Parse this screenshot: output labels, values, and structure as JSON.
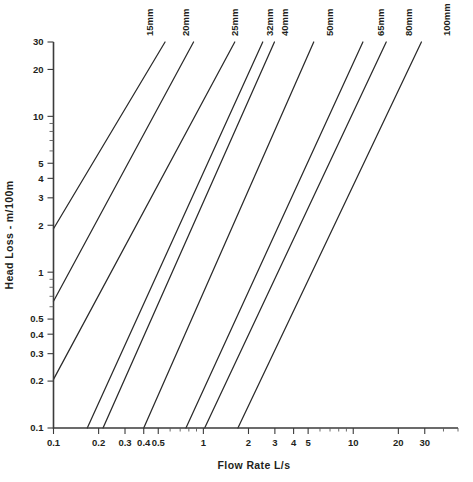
{
  "chart_data": {
    "type": "line",
    "title": "",
    "xlabel": "Flow Rate L/s",
    "ylabel": "Head Loss - m/100m",
    "xscale": "log",
    "yscale": "log",
    "xlim": [
      0.1,
      50
    ],
    "ylim": [
      0.1,
      30
    ],
    "grid": false,
    "legend_position": "top-inline-rotated",
    "x_tick_labels": [
      "0.1",
      "0.2",
      "0.3",
      "0.4",
      "0.5",
      "1",
      "2",
      "3",
      "4",
      "5",
      "10",
      "20",
      "30"
    ],
    "x_tick_values": [
      0.1,
      0.2,
      0.3,
      0.4,
      0.5,
      1,
      2,
      3,
      4,
      5,
      10,
      20,
      30
    ],
    "x_minor_ticks": [
      0.6,
      0.7,
      0.8,
      0.9,
      6,
      7,
      8,
      9,
      40,
      50
    ],
    "y_tick_labels": [
      "0.1",
      "0.2",
      "0.3",
      "0.4",
      "0.5",
      "1",
      "2",
      "3",
      "4",
      "5",
      "10",
      "20",
      "30"
    ],
    "y_tick_values": [
      0.1,
      0.2,
      0.3,
      0.4,
      0.5,
      1,
      2,
      3,
      4,
      5,
      10,
      20,
      30
    ],
    "y_minor_ticks": [
      0.6,
      0.7,
      0.8,
      0.9,
      6,
      7,
      8,
      9
    ],
    "series": [
      {
        "name": "15mm",
        "label": "15mm",
        "x": [
          0.1,
          0.555
        ],
        "y": [
          1.9,
          30.0
        ]
      },
      {
        "name": "20mm",
        "label": "20mm",
        "x": [
          0.1,
          0.86
        ],
        "y": [
          0.65,
          30.0
        ]
      },
      {
        "name": "25mm",
        "label": "25mm",
        "x": [
          0.1,
          1.62
        ],
        "y": [
          0.205,
          30.0
        ]
      },
      {
        "name": "32mm",
        "label": "32mm",
        "x": [
          0.168,
          2.49
        ],
        "y": [
          0.1,
          30.0
        ]
      },
      {
        "name": "40mm",
        "label": "40mm",
        "x": [
          0.214,
          2.98
        ],
        "y": [
          0.1,
          30.0
        ]
      },
      {
        "name": "50mm",
        "label": "50mm",
        "x": [
          0.4,
          5.45
        ],
        "y": [
          0.1,
          30.0
        ]
      },
      {
        "name": "65mm",
        "label": "65mm",
        "x": [
          0.765,
          11.6
        ],
        "y": [
          0.1,
          30.0
        ]
      },
      {
        "name": "80mm",
        "label": "80mm",
        "x": [
          1.02,
          16.6
        ],
        "y": [
          0.1,
          30.0
        ]
      },
      {
        "name": "100mm",
        "label": "100mm",
        "x": [
          1.7,
          28.5
        ],
        "y": [
          0.1,
          30.0
        ]
      }
    ],
    "series_label_x": [
      153,
      189,
      238,
      273,
      288,
      333,
      384,
      412,
      450
    ]
  }
}
